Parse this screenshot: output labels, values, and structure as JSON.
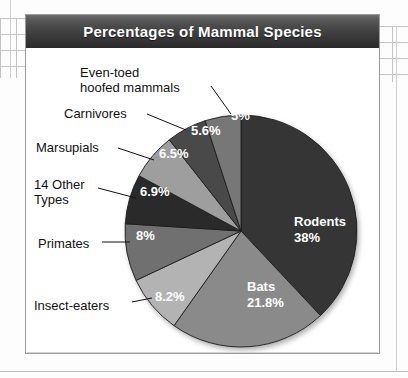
{
  "card": {
    "title": "Percentages of Mammal Species"
  },
  "chart_data": {
    "type": "pie",
    "title": "Percentages of Mammal Species",
    "xlabel": "",
    "ylabel": "",
    "legend": "none",
    "grid": false,
    "units": "percent of mammal species",
    "total": 100.0,
    "start_angle_deg": 0,
    "direction": "clockwise",
    "categories": [
      "Rodents",
      "Bats",
      "Insect-eaters",
      "Primates",
      "14 Other Types",
      "Marsupials",
      "Carnivores",
      "Even-toed hoofed mammals"
    ],
    "values": [
      38,
      21.8,
      8.2,
      8,
      6.9,
      6.5,
      5.6,
      5
    ],
    "value_labels": [
      "38%",
      "21.8%",
      "8.2%",
      "8%",
      "6.9%",
      "6.5%",
      "5.6%",
      "5%"
    ],
    "colors": [
      "#353535",
      "#8a8a8a",
      "#b3b3b3",
      "#707070",
      "#2b2b2b",
      "#9e9e9e",
      "#4a4a4a",
      "#777777"
    ],
    "slices": [
      {
        "name": "Rodents",
        "value": 38,
        "value_label": "38%",
        "color": "#353535",
        "label_placement": "inside",
        "inside_name": "Rodents",
        "inside_value": "38%",
        "inside_x": 268,
        "inside_y": 178,
        "text_color": "#ffffff"
      },
      {
        "name": "Bats",
        "value": 21.8,
        "value_label": "21.8%",
        "color": "#8a8a8a",
        "label_placement": "inside",
        "inside_name": "Bats",
        "inside_value": "21.8%",
        "inside_x": 221,
        "inside_y": 243,
        "text_color": "#ffffff"
      },
      {
        "name": "Insect-eaters",
        "value": 8.2,
        "value_label": "8.2%",
        "color": "#b3b3b3",
        "label_placement": "outside",
        "inside_value": "8.2%",
        "inside_x": 129,
        "inside_y": 253,
        "text_color": "#ffffff",
        "outer_label": "Insect-eaters",
        "outer_x": 8,
        "outer_y": 250,
        "leader": {
          "x1": 106,
          "y1": 254,
          "x2": 126,
          "y2": 250
        }
      },
      {
        "name": "Primates",
        "value": 8,
        "value_label": "8%",
        "color": "#707070",
        "label_placement": "outside",
        "inside_value": "8%",
        "inside_x": 110,
        "inside_y": 192,
        "text_color": "#ffffff",
        "outer_label": "Primates",
        "outer_x": 12,
        "outer_y": 188,
        "leader": {
          "x1": 76,
          "y1": 194,
          "x2": 104,
          "y2": 194
        }
      },
      {
        "name": "14 Other Types",
        "value": 6.9,
        "value_label": "6.9%",
        "color": "#2b2b2b",
        "label_placement": "outside",
        "inside_value": "6.9%",
        "inside_x": 114,
        "inside_y": 148,
        "text_color": "#ffffff",
        "outer_label": "14 Other\nTypes",
        "outer_x": 8,
        "outer_y": 129,
        "leader": {
          "x1": 72,
          "y1": 140,
          "x2": 110,
          "y2": 150
        }
      },
      {
        "name": "Marsupials",
        "value": 6.5,
        "value_label": "6.5%",
        "color": "#9e9e9e",
        "label_placement": "outside",
        "inside_value": "6.5%",
        "inside_x": 133,
        "inside_y": 110,
        "text_color": "#ffffff",
        "outer_label": "Marsupials",
        "outer_x": 10,
        "outer_y": 92,
        "leader": {
          "x1": 92,
          "y1": 100,
          "x2": 128,
          "y2": 112
        }
      },
      {
        "name": "Carnivores",
        "value": 5.6,
        "value_label": "5.6%",
        "color": "#4a4a4a",
        "label_placement": "outside",
        "inside_value": "5.6%",
        "inside_x": 165,
        "inside_y": 87,
        "text_color": "#ffffff",
        "outer_label": "Carnivores",
        "outer_x": 38,
        "outer_y": 58,
        "leader": {
          "x1": 121,
          "y1": 66,
          "x2": 160,
          "y2": 82
        }
      },
      {
        "name": "Even-toed hoofed mammals",
        "value": 5,
        "value_label": "5%",
        "color": "#777777",
        "label_placement": "outside",
        "inside_value": "5%",
        "inside_x": 205,
        "inside_y": 72,
        "text_color": "#ffffff",
        "outer_label": "Even-toed\nhoofed mammals",
        "outer_x": 54,
        "outer_y": 17,
        "leader": {
          "x1": 185,
          "y1": 38,
          "x2": 205,
          "y2": 66
        }
      }
    ]
  }
}
